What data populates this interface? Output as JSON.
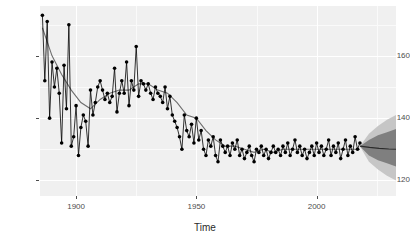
{
  "chart_data": {
    "type": "line",
    "title": "",
    "xlabel": "Time",
    "ylabel": "",
    "xlim": [
      1885,
      2033
    ],
    "ylim": [
      115,
      176
    ],
    "grid": true,
    "legend": null,
    "x_ticks": [
      1900,
      1950,
      2000
    ],
    "x_tick_labels": [
      "1900",
      "1950",
      "2000"
    ],
    "y_ticks": [
      120,
      140,
      160
    ],
    "y_tick_labels": [
      "120",
      "140",
      "160"
    ],
    "x_minor_ticks": [
      1875,
      1925,
      1975,
      2025
    ],
    "y_minor_ticks": [
      130,
      150,
      170
    ],
    "series": [
      {
        "name": "observed",
        "style": "line-with-points",
        "color": "#000000",
        "x": [
          1886,
          1887,
          1888,
          1889,
          1890,
          1891,
          1892,
          1893,
          1894,
          1895,
          1896,
          1897,
          1898,
          1899,
          1900,
          1901,
          1902,
          1903,
          1904,
          1905,
          1906,
          1907,
          1908,
          1909,
          1910,
          1911,
          1912,
          1913,
          1914,
          1915,
          1916,
          1917,
          1918,
          1919,
          1920,
          1921,
          1922,
          1923,
          1924,
          1925,
          1926,
          1927,
          1928,
          1929,
          1930,
          1931,
          1932,
          1933,
          1934,
          1935,
          1936,
          1937,
          1938,
          1939,
          1940,
          1941,
          1942,
          1943,
          1944,
          1945,
          1946,
          1947,
          1948,
          1949,
          1950,
          1951,
          1952,
          1953,
          1954,
          1955,
          1956,
          1957,
          1958,
          1959,
          1960,
          1961,
          1962,
          1963,
          1964,
          1965,
          1966,
          1967,
          1968,
          1969,
          1970,
          1971,
          1972,
          1973,
          1974,
          1975,
          1976,
          1977,
          1978,
          1979,
          1980,
          1981,
          1982,
          1983,
          1984,
          1985,
          1986,
          1987,
          1988,
          1989,
          1990,
          1991,
          1992,
          1993,
          1994,
          1995,
          1996,
          1997,
          1998,
          1999,
          2000,
          2001,
          2002,
          2003,
          2004,
          2005,
          2006,
          2007,
          2008,
          2009,
          2010,
          2011,
          2012,
          2013,
          2014,
          2015,
          2016,
          2017,
          2018
        ],
        "y": [
          173,
          152,
          171,
          140,
          158,
          150,
          156,
          148,
          132,
          157,
          143,
          170,
          131,
          134,
          144,
          128,
          137,
          141,
          139,
          131,
          149,
          141,
          145,
          150,
          152,
          149,
          146,
          148,
          145,
          147,
          156,
          142,
          148,
          152,
          148,
          158,
          144,
          152,
          149,
          163,
          147,
          152,
          151,
          149,
          151,
          148,
          146,
          150,
          148,
          147,
          145,
          150,
          143,
          147,
          141,
          139,
          137,
          134,
          130,
          141,
          136,
          134,
          138,
          132,
          140,
          133,
          136,
          130,
          128,
          133,
          131,
          134,
          128,
          126,
          133,
          131,
          129,
          131,
          128,
          132,
          130,
          133,
          128,
          130,
          127,
          129,
          131,
          128,
          126,
          130,
          129,
          131,
          128,
          130,
          127,
          129,
          131,
          129,
          130,
          128,
          131,
          129,
          132,
          128,
          130,
          133,
          129,
          131,
          128,
          130,
          127,
          129,
          131,
          128,
          132,
          129,
          131,
          128,
          130,
          133,
          128,
          131,
          129,
          132,
          127,
          130,
          133,
          128,
          131,
          129,
          134,
          130,
          132
        ]
      },
      {
        "name": "trend-smooth",
        "style": "line",
        "color": "#6e6e6e",
        "x": [
          1886,
          1890,
          1894,
          1898,
          1902,
          1906,
          1910,
          1914,
          1918,
          1922,
          1926,
          1930,
          1934,
          1938,
          1942,
          1946,
          1950,
          1954,
          1958,
          1962,
          1966,
          1970,
          1974,
          1978,
          1982,
          1986,
          1990,
          1994,
          1998,
          2002,
          2006,
          2010,
          2014,
          2018
        ],
        "y": [
          169,
          160,
          154,
          149,
          145,
          143,
          146,
          148,
          149,
          149,
          151,
          151,
          149,
          148,
          145,
          141,
          140,
          136,
          133,
          131,
          131,
          130,
          129,
          130,
          129,
          130,
          130,
          130,
          130,
          130,
          130,
          130,
          130,
          130
        ]
      },
      {
        "name": "forecast-mean",
        "style": "line",
        "color": "#333333",
        "x": [
          2018,
          2022,
          2026,
          2030,
          2033
        ],
        "y": [
          131,
          130.6,
          130.3,
          130.1,
          130
        ]
      }
    ],
    "forecast": {
      "start_year": 2018,
      "end_year": 2033,
      "intervals": [
        {
          "level": 95,
          "color": "#c6c6c6",
          "lower": [
            131,
            126,
            123.5,
            121.5,
            120
          ],
          "upper": [
            131,
            135,
            137.5,
            139.5,
            141
          ]
        },
        {
          "level": 80,
          "color": "#7f7f7f",
          "lower": [
            131,
            128,
            126.5,
            125.5,
            124.5
          ],
          "upper": [
            131,
            133,
            134.5,
            135.5,
            136.5
          ]
        }
      ]
    }
  },
  "axes": {
    "x_title": "Time"
  }
}
